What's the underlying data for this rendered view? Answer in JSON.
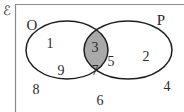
{
  "diagram": {
    "type": "venn",
    "universal_symbol": "ℰ",
    "colors": {
      "outline": "#1e1e1e",
      "frame": "#8a8a8a",
      "intersection_fill": "#a9a9a9",
      "background": "#ffffff"
    },
    "sets": [
      {
        "name": "O",
        "label": "O",
        "elements": [
          "1",
          "9",
          "3",
          "7",
          "5"
        ]
      },
      {
        "name": "P",
        "label": "P",
        "elements": [
          "3",
          "7",
          "5",
          "2"
        ]
      }
    ],
    "regions": {
      "only_O": [
        "1",
        "9"
      ],
      "O_and_P": [
        "3",
        "7",
        "5"
      ],
      "only_P": [
        "2"
      ],
      "outside": [
        "8",
        "6",
        "4"
      ]
    },
    "shaded_region": "O ∩ P",
    "labels": {
      "O": "O",
      "P": "P",
      "n1": "1",
      "n9": "9",
      "n8": "8",
      "n3": "3",
      "n7": "7",
      "n5": "5",
      "n2": "2",
      "n4": "4",
      "n6": "6"
    }
  }
}
